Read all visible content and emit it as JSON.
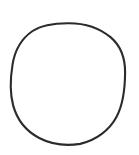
{
  "image": {
    "title": "Hand-drawn circle outline",
    "width": 139,
    "height": 155,
    "background_color": "#ffffff",
    "description": "A single thin, slightly irregular hand-drawn circle outline in dark ink on a plain white background."
  },
  "shape": {
    "name": "circle-outline",
    "kind": "circle",
    "stroke_color": "#2b2b2b",
    "stroke_width": 2.1,
    "fill": "none",
    "center_x": 68,
    "center_y": 84,
    "radius_x": 57,
    "radius_y": 61,
    "bounds": {
      "left": 11,
      "top": 23,
      "right": 125,
      "bottom": 145
    },
    "path": "M 68.0 23.2 C 84.5 23.0 99.8 28.2 110.8 37.4 C 121.0 46.2 125.2 59.0 125.1 72.6 C 125.0 89.0 123.4 104.0 116.6 116.8 C 109.4 130.4 95.6 140.6 80.2 143.9 C 66.4 146.0 51.4 144.4 39.2 138.0 C 26.4 131.2 17.0 119.4 13.2 105.6 C 9.6 92.4 10.4 77.6 12.6 64.2 C 14.8 50.8 21.4 38.6 32.6 31.0 C 42.6 24.4 55.2 23.3 68.0 23.2 Z"
  }
}
